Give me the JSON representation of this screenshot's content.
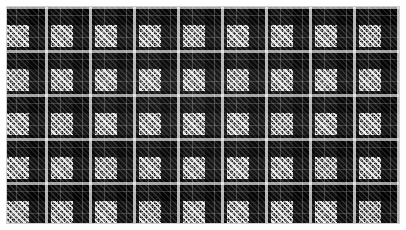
{
  "image": {
    "kind": "textile-swatch-photo",
    "width_px": 406,
    "height_px": 230,
    "caption": "Black and white glen plaid (Prince of Wales check) woven fabric swatch",
    "border": {
      "name": "white-mount-border",
      "color": "#ffffff",
      "width_px": 7,
      "hairline_color": "#cfcfcf"
    },
    "cloth": {
      "name": "glen-plaid-cloth",
      "width_px": 392,
      "height_px": 216,
      "weave": "houndstooth",
      "pattern_name": "glen plaid",
      "repeat_px": 44,
      "block_px": 22,
      "houndstooth_cell_px": 4,
      "colors": {
        "ground": "#111111",
        "dark_block": "#0a0a0a",
        "light_block": "#b9b9b9",
        "overcheck": "#f2f2f2",
        "highlight": "#ffffff"
      },
      "overcheck": {
        "name": "white-overcheck-grid",
        "spacing_px": 44,
        "stripe_width_px": 3,
        "color": "#f2f2f2",
        "orientation": "both"
      },
      "pinstripe": {
        "name": "inner-pinstripe",
        "spacing_px": 22,
        "stripe_width_px": 1,
        "color": "#d8d8d8"
      }
    }
  }
}
